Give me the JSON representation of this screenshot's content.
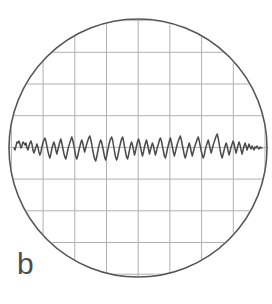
{
  "figure": {
    "panel_label": "b",
    "label_color": "#4d4d4d",
    "background_color": "#ffffff"
  },
  "scope": {
    "bezel": {
      "name": "circular-crt-bezel",
      "center_x": 138,
      "center_y": 148,
      "radius": 129,
      "stroke_color": "#555555",
      "stroke_width": 1.6
    },
    "graticule": {
      "name": "oscilloscope-graticule",
      "grid_color": "#b0b0b0",
      "grid_stroke_width": 1.0,
      "spacing_px": 31.7,
      "vertical_lines_x": [
        11.4,
        43.1,
        74.8,
        106.5,
        138.2,
        169.9,
        201.6,
        233.3,
        265.0
      ],
      "horizontal_lines_y": [
        20.6,
        52.3,
        84.0,
        115.7,
        147.4,
        179.1,
        210.8,
        242.5,
        274.2
      ],
      "center_line_x": 138.2,
      "center_line_y": 147.4
    },
    "trace": {
      "name": "noise-waveform-trace",
      "stroke_color": "#4a4a4a",
      "stroke_width": 1.5,
      "baseline_y": 148,
      "description": "random noise signal centered on the horizontal centerline",
      "x_start": 14,
      "x_end": 262,
      "sample_step_px": 2,
      "amplitude_px": 12,
      "points_y": [
        148,
        150,
        146,
        142,
        143,
        141,
        144,
        148,
        146,
        142,
        143,
        145,
        143,
        148,
        150,
        146,
        143,
        141,
        144,
        150,
        153,
        150,
        147,
        144,
        147,
        152,
        155,
        152,
        147,
        143,
        140,
        138,
        141,
        146,
        151,
        155,
        158,
        154,
        149,
        145,
        142,
        145,
        150,
        154,
        150,
        146,
        142,
        139,
        143,
        148,
        153,
        157,
        159,
        155,
        150,
        146,
        143,
        140,
        137,
        140,
        145,
        151,
        156,
        159,
        156,
        151,
        147,
        143,
        140,
        143,
        148,
        152,
        148,
        144,
        141,
        138,
        136,
        139,
        144,
        150,
        155,
        159,
        161,
        157,
        152,
        147,
        143,
        140,
        142,
        147,
        152,
        157,
        160,
        156,
        151,
        146,
        142,
        139,
        137,
        140,
        146,
        152,
        157,
        160,
        157,
        152,
        147,
        143,
        139,
        137,
        141,
        147,
        152,
        157,
        159,
        155,
        150,
        145,
        142,
        145,
        150,
        155,
        151,
        146,
        142,
        139,
        142,
        147,
        152,
        156,
        152,
        147,
        143,
        140,
        144,
        149,
        154,
        150,
        146,
        143,
        146,
        151,
        155,
        151,
        147,
        144,
        140,
        138,
        141,
        146,
        151,
        156,
        158,
        154,
        149,
        145,
        141,
        138,
        142,
        147,
        152,
        156,
        152,
        148,
        144,
        141,
        138,
        136,
        140,
        145,
        150,
        155,
        158,
        154,
        150,
        146,
        143,
        147,
        152,
        156,
        152,
        148,
        145,
        142,
        139,
        137,
        141,
        146,
        151,
        155,
        158,
        155,
        150,
        146,
        143,
        140,
        144,
        149,
        153,
        149,
        145,
        142,
        139,
        136,
        134,
        138,
        144,
        150,
        155,
        158,
        154,
        150,
        146,
        143,
        146,
        151,
        155,
        151,
        147,
        144,
        141,
        144,
        149,
        153,
        149,
        145,
        142,
        145,
        150,
        154,
        150,
        146,
        143,
        146,
        150,
        147,
        144,
        147,
        149,
        146,
        148,
        150,
        147,
        148,
        146,
        148,
        149,
        147,
        148,
        148
      ]
    }
  }
}
